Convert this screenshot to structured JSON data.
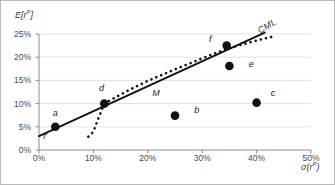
{
  "chart_data": {
    "type": "scatter",
    "title": "",
    "xlabel": "σ(rᵖ)",
    "ylabel": "E[rᵖ]",
    "xlabel_base": "σ(r",
    "xlabel_sup": "P",
    "xlabel_close": ")",
    "ylabel_base": "E[r",
    "ylabel_sup": "P",
    "ylabel_close": "]",
    "xlim": [
      0,
      50
    ],
    "ylim": [
      0,
      25
    ],
    "grid": true,
    "grid_axis": "y",
    "legend": "none",
    "xticks": [
      "0%",
      "10%",
      "20%",
      "30%",
      "40%",
      "50%"
    ],
    "xtick_values": [
      0,
      10,
      20,
      30,
      40,
      50
    ],
    "yticks": [
      "0%",
      "5%",
      "10%",
      "15%",
      "20%",
      "25%"
    ],
    "ytick_values": [
      0,
      5,
      10,
      15,
      20,
      25
    ],
    "points": [
      {
        "label": "a",
        "x": 3.0,
        "y": 5.0,
        "lx": 3.0,
        "ly": 8.0
      },
      {
        "label": "d",
        "x": 12.0,
        "y": 10.0,
        "lx": 11.5,
        "ly": 13.4
      },
      {
        "label": "b",
        "x": 25.0,
        "y": 7.4,
        "lx": 29.0,
        "ly": 8.7
      },
      {
        "label": "c",
        "x": 40.0,
        "y": 10.2,
        "lx": 43.0,
        "ly": 12.3
      },
      {
        "label": "e",
        "x": 35.0,
        "y": 18.1,
        "lx": 39.0,
        "ly": 18.6
      },
      {
        "label": "f",
        "x": 34.5,
        "y": 22.5,
        "lx": 31.5,
        "ly": 24.0
      }
    ],
    "annotations": [
      {
        "name": "market-portfolio",
        "label": "M",
        "x": 21.5,
        "ly": 12.2
      },
      {
        "name": "cml-line",
        "label": "CML",
        "x": 42.0,
        "ly": 26.8
      },
      {
        "name": "risk-free-rate",
        "label": "r",
        "sup": "f",
        "x": 1.2,
        "ly": 3.2
      }
    ],
    "cml": {
      "name": "capital-market-line",
      "style": "solid",
      "from": {
        "x": 0.0,
        "y": 3.0
      },
      "to": {
        "x": 41.5,
        "y": 25.3
      }
    },
    "efficient_frontier": {
      "name": "efficient-frontier",
      "style": "dotted",
      "upper_points": [
        {
          "x": 12.0,
          "y": 10.0
        },
        {
          "x": 16.0,
          "y": 12.6
        },
        {
          "x": 20.0,
          "y": 14.9
        },
        {
          "x": 24.0,
          "y": 16.9
        },
        {
          "x": 28.0,
          "y": 18.8
        },
        {
          "x": 32.0,
          "y": 20.7
        },
        {
          "x": 36.0,
          "y": 22.3
        },
        {
          "x": 40.0,
          "y": 23.6
        },
        {
          "x": 43.5,
          "y": 24.6
        }
      ],
      "lower_points": [
        {
          "x": 12.0,
          "y": 10.0
        },
        {
          "x": 11.4,
          "y": 8.2
        },
        {
          "x": 10.8,
          "y": 6.5
        },
        {
          "x": 10.4,
          "y": 5.2
        },
        {
          "x": 10.0,
          "y": 4.0
        },
        {
          "x": 9.4,
          "y": 3.1
        },
        {
          "x": 8.6,
          "y": 2.6
        }
      ]
    },
    "colors": {
      "marker": "#111111",
      "line": "#111111",
      "grid": "#d9d9d9",
      "axis": "#8c8c8c",
      "text": "#3a3a3a",
      "background": "#ffffff"
    }
  }
}
